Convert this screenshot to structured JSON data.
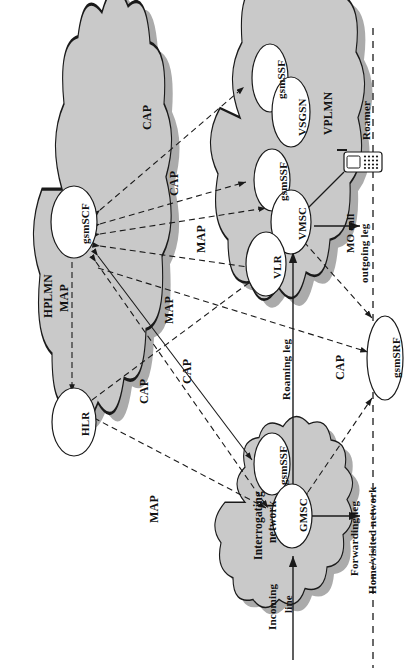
{
  "diagram": {
    "type": "network-architecture",
    "orientation": "rotated-90-ccw",
    "colors": {
      "cloud_fill": "#c9c9c9",
      "cloud_shadow": "#8f8f8f",
      "cloud_stroke": "#1a1a1a",
      "node_fill": "#ffffff",
      "node_stroke": "#1a1a1a",
      "line": "#1a1a1a",
      "background": "#ffffff"
    }
  },
  "clouds": [
    {
      "id": "hplmn",
      "label": "HPLMN"
    },
    {
      "id": "vplmn",
      "label": "VPLMN"
    },
    {
      "id": "interrogating",
      "label": "Interrogating\nnetwork",
      "line1": "Interrogating",
      "line2": "network"
    }
  ],
  "nodes": [
    {
      "id": "gsmscf",
      "label": "gsmSCF",
      "cloud": "hplmn"
    },
    {
      "id": "hlr",
      "label": "HLR",
      "cloud": "hplmn"
    },
    {
      "id": "gsmssf1",
      "label": "gsmSSF",
      "cloud": "vplmn"
    },
    {
      "id": "vsgsn",
      "label": "VSGSN",
      "cloud": "vplmn"
    },
    {
      "id": "gsmssf2",
      "label": "gsmSSF",
      "cloud": "vplmn"
    },
    {
      "id": "vmsc",
      "label": "VMSC",
      "cloud": "vplmn"
    },
    {
      "id": "vlr",
      "label": "VLR",
      "cloud": "vplmn"
    },
    {
      "id": "gsmssf3",
      "label": "gsmSSF",
      "cloud": "interrogating"
    },
    {
      "id": "gmsc",
      "label": "GMSC",
      "cloud": "interrogating"
    },
    {
      "id": "gsmsrf",
      "label": "gsmSRF",
      "cloud": null
    }
  ],
  "links": [
    {
      "id": "cap-gsmssf1-gsmscf",
      "label": "CAP",
      "style": "dashed",
      "from": "gsmSCF",
      "to": "gsmSSF (VSGSN)"
    },
    {
      "id": "cap-gsmssf2-gsmscf",
      "label": "CAP",
      "style": "dashed",
      "from": "gsmSCF",
      "to": "gsmSSF (VMSC)"
    },
    {
      "id": "map-vlr-gsmscf",
      "label": "MAP",
      "style": "dashed",
      "from": "gsmSCF",
      "to": "VLR"
    },
    {
      "id": "map-gsmscf-hlr",
      "label": "MAP",
      "style": "dashed",
      "from": "gsmSCF",
      "to": "HLR"
    },
    {
      "id": "map-centre",
      "label": "MAP",
      "style": "dashed",
      "from": "gsmSCF",
      "to": "GMSC"
    },
    {
      "id": "cap-centre",
      "label": "CAP",
      "style": "dashed",
      "from": "gsmSCF",
      "to": "gsmSSF (GMSC)"
    },
    {
      "id": "cap-lower",
      "label": "CAP",
      "style": "dashed",
      "from": "gsmSCF",
      "to": "gsmSSF (GMSC)"
    },
    {
      "id": "map-hlr-gmsc",
      "label": "MAP",
      "style": "dashed",
      "from": "HLR",
      "to": "GMSC"
    },
    {
      "id": "cap-gsmsrf",
      "label": "CAP",
      "style": "dashed",
      "from": "gsmSCF",
      "to": "gsmSRF"
    }
  ],
  "legs": [
    {
      "id": "incoming-line",
      "line1": "Incoming",
      "line2": "line",
      "style": "solid"
    },
    {
      "id": "roaming-leg",
      "line1": "Roaming leg",
      "line2": "",
      "style": "solid"
    },
    {
      "id": "forwarding-leg",
      "line1": "Forwarding leg",
      "line2": "",
      "style": "solid"
    },
    {
      "id": "mo-call-leg",
      "line1": "MO call",
      "line2": "outgoing leg",
      "style": "solid"
    }
  ],
  "annotations": {
    "roamer": "Roamer",
    "boundary": "Home/visited network"
  }
}
